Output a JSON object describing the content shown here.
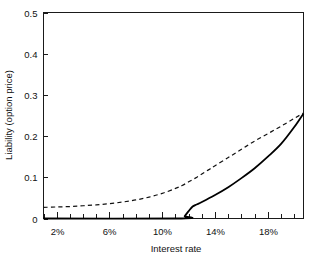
{
  "chart_data": {
    "type": "line",
    "title": "",
    "xlabel": "Interest rate",
    "ylabel": "Liability (option price)",
    "xlim": [
      1.0,
      20.7
    ],
    "ylim": [
      0,
      0.5
    ],
    "grid": false,
    "legend_position": "none",
    "x_tick_labels": [
      "2%",
      "6%",
      "10%",
      "14%",
      "18%"
    ],
    "x_tick_values": [
      2,
      6,
      10,
      14,
      18
    ],
    "x_minor_tick_step": 1,
    "y_tick_labels": [
      "0",
      "0.1",
      "0.2",
      "0.3",
      "0.4",
      "0.5"
    ],
    "y_tick_values": [
      0,
      0.1,
      0.2,
      0.3,
      0.4,
      0.5
    ],
    "series": [
      {
        "name": "option price (dashed)",
        "style": "dashed",
        "color": "#111111",
        "x": [
          1.0,
          2.0,
          3.0,
          4.0,
          5.0,
          6.0,
          7.0,
          8.0,
          9.0,
          10.0,
          11.0,
          11.5,
          12.0,
          12.5,
          13.0,
          13.5,
          14.0,
          15.0,
          16.0,
          17.0,
          18.0,
          19.0,
          20.0,
          20.7
        ],
        "y": [
          0.027,
          0.028,
          0.029,
          0.031,
          0.033,
          0.036,
          0.04,
          0.045,
          0.052,
          0.061,
          0.073,
          0.08,
          0.089,
          0.098,
          0.108,
          0.118,
          0.128,
          0.148,
          0.168,
          0.188,
          0.206,
          0.224,
          0.243,
          0.256
        ]
      },
      {
        "name": "intrinsic value (solid)",
        "style": "solid",
        "color": "#000000",
        "x": [
          1.0,
          11.45,
          11.7,
          12.0,
          12.3,
          12.6,
          13.0,
          14.0,
          15.0,
          16.0,
          17.0,
          18.0,
          19.0,
          20.0,
          20.7
        ],
        "y": [
          0.0,
          0.0,
          0.006,
          0.018,
          0.029,
          0.034,
          0.04,
          0.057,
          0.076,
          0.098,
          0.122,
          0.15,
          0.181,
          0.222,
          0.255
        ]
      }
    ]
  },
  "axes": {
    "y_title": "Liability (option price)",
    "x_title": "Interest rate"
  }
}
